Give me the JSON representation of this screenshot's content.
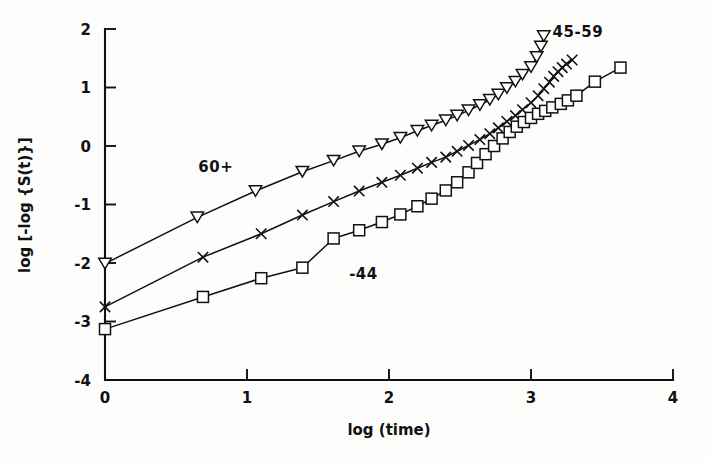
{
  "figure": {
    "background_color": "#fdfdfc",
    "ink_color": "#111111"
  },
  "chart_data": {
    "type": "line",
    "title": "",
    "subtitle": "",
    "xlabel": "log (time)",
    "ylabel": "log [-log {S(t)}]",
    "xlim": [
      0,
      4
    ],
    "ylim": [
      -4,
      2
    ],
    "xticks": [
      0,
      1,
      2,
      3,
      4
    ],
    "xtick_labels": [
      "0",
      "1",
      "2",
      "3",
      "4"
    ],
    "yticks": [
      -4,
      -3,
      -2,
      -1,
      0,
      1,
      2
    ],
    "ytick_labels": [
      "-4",
      "-3",
      "-2",
      "-1",
      "0",
      "1",
      "2"
    ],
    "grid": false,
    "legend_position": "inline-annotations",
    "annotations": [
      {
        "text": "60+",
        "x": 0.78,
        "y": -0.45,
        "series": "60+"
      },
      {
        "text": "45-59",
        "x": 3.33,
        "y": 1.87,
        "series": "45-59"
      },
      {
        "text": "-44",
        "x": 1.82,
        "y": -2.28,
        "series": "-44"
      }
    ],
    "series": [
      {
        "name": "60+",
        "marker": "triangle-down-open",
        "label_text": "60+",
        "points": [
          [
            0.0,
            -2.01
          ],
          [
            0.65,
            -1.22
          ],
          [
            1.06,
            -0.77
          ],
          [
            1.39,
            -0.44
          ],
          [
            1.61,
            -0.25
          ],
          [
            1.79,
            -0.09
          ],
          [
            1.95,
            0.03
          ],
          [
            2.08,
            0.14
          ],
          [
            2.2,
            0.26
          ],
          [
            2.3,
            0.35
          ],
          [
            2.4,
            0.44
          ],
          [
            2.48,
            0.52
          ],
          [
            2.56,
            0.61
          ],
          [
            2.64,
            0.7
          ],
          [
            2.71,
            0.79
          ],
          [
            2.77,
            0.88
          ],
          [
            2.83,
            0.99
          ],
          [
            2.89,
            1.1
          ],
          [
            2.94,
            1.22
          ],
          [
            3.0,
            1.35
          ],
          [
            3.04,
            1.52
          ],
          [
            3.07,
            1.7
          ],
          [
            3.09,
            1.88
          ]
        ]
      },
      {
        "name": "45-59",
        "marker": "x-cross",
        "label_text": "45-59",
        "points": [
          [
            0.0,
            -2.75
          ],
          [
            0.69,
            -1.9
          ],
          [
            1.1,
            -1.5
          ],
          [
            1.39,
            -1.18
          ],
          [
            1.61,
            -0.95
          ],
          [
            1.79,
            -0.77
          ],
          [
            1.95,
            -0.62
          ],
          [
            2.08,
            -0.5
          ],
          [
            2.2,
            -0.38
          ],
          [
            2.3,
            -0.28
          ],
          [
            2.4,
            -0.19
          ],
          [
            2.48,
            -0.09
          ],
          [
            2.56,
            0.01
          ],
          [
            2.64,
            0.11
          ],
          [
            2.71,
            0.21
          ],
          [
            2.77,
            0.31
          ],
          [
            2.83,
            0.42
          ],
          [
            2.89,
            0.52
          ],
          [
            2.94,
            0.62
          ],
          [
            3.0,
            0.74
          ],
          [
            3.05,
            0.86
          ],
          [
            3.09,
            0.98
          ],
          [
            3.13,
            1.09
          ],
          [
            3.16,
            1.19
          ],
          [
            3.19,
            1.27
          ],
          [
            3.22,
            1.34
          ],
          [
            3.25,
            1.4
          ],
          [
            3.29,
            1.47
          ]
        ]
      },
      {
        "name": "-44",
        "marker": "square-open",
        "label_text": "-44",
        "points": [
          [
            0.0,
            -3.13
          ],
          [
            0.69,
            -2.58
          ],
          [
            1.1,
            -2.26
          ],
          [
            1.39,
            -2.08
          ],
          [
            1.61,
            -1.58
          ],
          [
            1.79,
            -1.44
          ],
          [
            1.95,
            -1.3
          ],
          [
            2.08,
            -1.17
          ],
          [
            2.2,
            -1.03
          ],
          [
            2.3,
            -0.9
          ],
          [
            2.4,
            -0.76
          ],
          [
            2.48,
            -0.62
          ],
          [
            2.56,
            -0.45
          ],
          [
            2.62,
            -0.29
          ],
          [
            2.68,
            -0.14
          ],
          [
            2.74,
            0.0
          ],
          [
            2.8,
            0.13
          ],
          [
            2.85,
            0.24
          ],
          [
            2.9,
            0.33
          ],
          [
            2.95,
            0.41
          ],
          [
            3.0,
            0.48
          ],
          [
            3.05,
            0.55
          ],
          [
            3.1,
            0.6
          ],
          [
            3.15,
            0.66
          ],
          [
            3.21,
            0.72
          ],
          [
            3.26,
            0.78
          ],
          [
            3.32,
            0.86
          ],
          [
            3.45,
            1.1
          ],
          [
            3.63,
            1.34
          ]
        ]
      }
    ]
  }
}
